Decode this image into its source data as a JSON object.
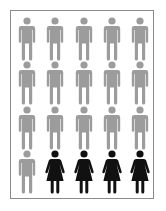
{
  "chart_data": {
    "type": "pictogram",
    "title": "",
    "total": 20,
    "columns": 5,
    "rows": 4,
    "series": [
      {
        "name": "male",
        "icon": "male-figure-icon",
        "count": 16,
        "percent": 80,
        "color": "#9c9c9c"
      },
      {
        "name": "female",
        "icon": "female-figure-icon",
        "count": 4,
        "percent": 20,
        "color": "#111111"
      }
    ],
    "grid": [
      [
        "male",
        "male",
        "male",
        "male",
        "male"
      ],
      [
        "male",
        "male",
        "male",
        "male",
        "male"
      ],
      [
        "male",
        "male",
        "male",
        "male",
        "male"
      ],
      [
        "male",
        "female",
        "female",
        "female",
        "female"
      ]
    ],
    "legend": "none",
    "xlabel": "",
    "ylabel": ""
  },
  "colors": {
    "male": "#9c9c9c",
    "female": "#111111",
    "frame_border": "#8a8a8a",
    "background": "#ffffff"
  },
  "a11y": {
    "summary": "16 of 20 figures male (gray), 4 of 20 female (black)"
  }
}
